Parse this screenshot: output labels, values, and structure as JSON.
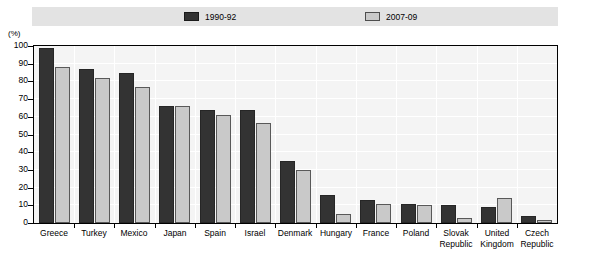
{
  "axis_unit_label": "(%)",
  "legend": {
    "entries": [
      {
        "label": "1990-92",
        "color": "#333333",
        "swatch": "dark-swatch"
      },
      {
        "label": "2007-09",
        "color": "#c9c9c9",
        "swatch": "light-swatch"
      }
    ]
  },
  "chart_data": {
    "type": "bar",
    "title": "",
    "subtitle": "",
    "xlabel": "",
    "ylabel": "(%)",
    "ylim": [
      0,
      100
    ],
    "ytick_labels": [
      "0",
      "10",
      "20",
      "30",
      "40",
      "50",
      "60",
      "70",
      "80",
      "90",
      "100"
    ],
    "ytick_values": [
      0,
      10,
      20,
      30,
      40,
      50,
      60,
      70,
      80,
      90,
      100
    ],
    "grid": true,
    "legend_position": "top",
    "categories": [
      "Greece",
      "Turkey",
      "Mexico",
      "Japan",
      "Spain",
      "Israel",
      "Denmark",
      "Hungary",
      "France",
      "Poland",
      "Slovak Republic",
      "United Kingdom",
      "Czech Republic"
    ],
    "series": [
      {
        "name": "1990-92",
        "color": "#333333",
        "values": [
          99,
          87,
          85,
          66,
          64,
          64,
          35,
          16,
          13,
          11,
          10,
          9,
          4
        ]
      },
      {
        "name": "2007-09",
        "color": "#c9c9c9",
        "values": [
          88,
          82,
          77,
          66,
          61,
          56.5,
          30,
          5,
          10.5,
          10,
          3,
          14,
          1.5
        ]
      }
    ]
  }
}
